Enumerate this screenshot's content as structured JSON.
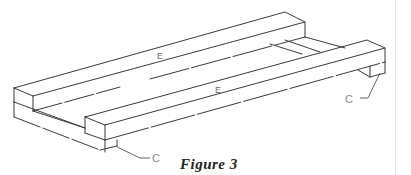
{
  "figure": {
    "caption": "Figure 3",
    "labels": {
      "top_rail_upper": "E",
      "top_rail_lower": "E",
      "callout_left": "C",
      "callout_right": "C"
    }
  }
}
